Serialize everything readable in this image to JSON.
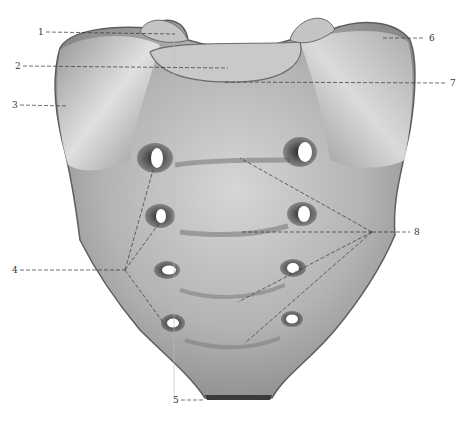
{
  "figure": {
    "background": "#ffffff",
    "bone_color_light": "#d8d8d8",
    "bone_color_mid": "#a9a9a9",
    "bone_color_dark": "#4a4a4a",
    "leader_color": "#333333"
  },
  "labels": [
    {
      "id": "1",
      "text": "1",
      "x": 38,
      "y": 28
    },
    {
      "id": "2",
      "text": "2",
      "x": 15,
      "y": 62
    },
    {
      "id": "3",
      "text": "3",
      "x": 12,
      "y": 101
    },
    {
      "id": "4",
      "text": "4",
      "x": 12,
      "y": 266
    },
    {
      "id": "5",
      "text": "5",
      "x": 173,
      "y": 396
    },
    {
      "id": "6",
      "text": "6",
      "x": 429,
      "y": 34
    },
    {
      "id": "7",
      "text": "7",
      "x": 450,
      "y": 79
    },
    {
      "id": "8",
      "text": "8",
      "x": 414,
      "y": 228
    }
  ]
}
